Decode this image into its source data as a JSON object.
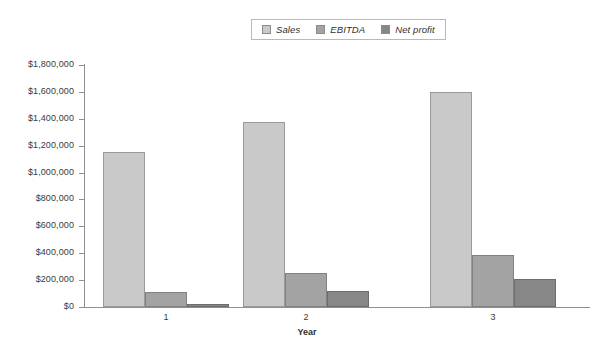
{
  "chart_data": {
    "type": "bar",
    "title": "",
    "xlabel": "Year",
    "ylabel": "",
    "categories": [
      "1",
      "2",
      "3"
    ],
    "series": [
      {
        "name": "Sales",
        "values": [
          1150000,
          1375000,
          1600000
        ],
        "color": "#c9c9c9"
      },
      {
        "name": "EBITDA",
        "values": [
          115000,
          250000,
          390000
        ],
        "color": "#a3a3a3"
      },
      {
        "name": "Net profit",
        "values": [
          25000,
          120000,
          205000
        ],
        "color": "#878787"
      }
    ],
    "ylim": [
      0,
      1800000
    ],
    "ytick_values": [
      0,
      200000,
      400000,
      600000,
      800000,
      1000000,
      1200000,
      1400000,
      1600000,
      1800000
    ],
    "ytick_labels": [
      "$0",
      "$200,000",
      "$400,000",
      "$600,000",
      "$800,000",
      "$1,000,000",
      "$1,200,000",
      "$1,400,000",
      "$1,600,000",
      "$1,800,000"
    ],
    "grid": false,
    "legend_position": "top-center"
  },
  "legend": {
    "items": [
      {
        "label": "Sales"
      },
      {
        "label": "EBITDA"
      },
      {
        "label": "Net profit"
      }
    ]
  },
  "axis": {
    "x_title": "Year"
  }
}
